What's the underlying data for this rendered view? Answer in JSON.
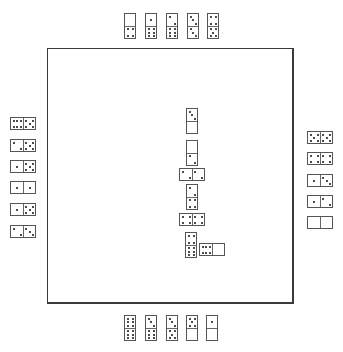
{
  "game": "dominoes",
  "colors": {
    "background": "#ffffff",
    "board_border": "#3a3a3a",
    "tile_border": "#555555",
    "pip": "#111111"
  },
  "board": {
    "x": 47,
    "y": 48,
    "width": 247,
    "height": 256
  },
  "hands": {
    "top": {
      "orientation": "vertical",
      "tiles": [
        {
          "a": 0,
          "b": 4,
          "x": 124,
          "y": 13
        },
        {
          "a": 1,
          "b": 6,
          "x": 145,
          "y": 13
        },
        {
          "a": 2,
          "b": 6,
          "x": 166,
          "y": 13
        },
        {
          "a": 3,
          "b": 3,
          "x": 187,
          "y": 13
        },
        {
          "a": 4,
          "b": 5,
          "x": 207,
          "y": 13
        }
      ]
    },
    "left": {
      "orientation": "horizontal",
      "tiles": [
        {
          "a": 6,
          "b": 5,
          "x": 10,
          "y": 117
        },
        {
          "a": 2,
          "b": 5,
          "x": 10,
          "y": 139
        },
        {
          "a": 1,
          "b": 5,
          "x": 10,
          "y": 160
        },
        {
          "a": 1,
          "b": 1,
          "x": 10,
          "y": 181
        },
        {
          "a": 1,
          "b": 5,
          "x": 10,
          "y": 203
        },
        {
          "a": 2,
          "b": 3,
          "x": 10,
          "y": 225
        }
      ]
    },
    "right": {
      "orientation": "horizontal",
      "tiles": [
        {
          "a": 5,
          "b": 5,
          "x": 307,
          "y": 131
        },
        {
          "a": 4,
          "b": 4,
          "x": 307,
          "y": 152
        },
        {
          "a": 1,
          "b": 3,
          "x": 307,
          "y": 174
        },
        {
          "a": 1,
          "b": 2,
          "x": 307,
          "y": 195
        },
        {
          "a": 0,
          "b": 0,
          "x": 307,
          "y": 216
        }
      ]
    },
    "bottom": {
      "orientation": "vertical",
      "tiles": [
        {
          "a": 6,
          "b": 6,
          "x": 124,
          "y": 315
        },
        {
          "a": 3,
          "b": 6,
          "x": 145,
          "y": 315
        },
        {
          "a": 3,
          "b": 5,
          "x": 166,
          "y": 315
        },
        {
          "a": 5,
          "b": 0,
          "x": 186,
          "y": 315
        },
        {
          "a": 1,
          "b": 0,
          "x": 206,
          "y": 315
        }
      ]
    }
  },
  "chain": [
    {
      "a": 3,
      "b": 0,
      "o": "v",
      "x": 186,
      "y": 108
    },
    {
      "a": 0,
      "b": 2,
      "o": "v",
      "x": 186,
      "y": 140
    },
    {
      "a": 2,
      "b": 2,
      "o": "h",
      "x": 179,
      "y": 168
    },
    {
      "a": 2,
      "b": 4,
      "o": "v",
      "x": 186,
      "y": 184
    },
    {
      "a": 4,
      "b": 4,
      "o": "h",
      "x": 179,
      "y": 213
    },
    {
      "a": 4,
      "b": 6,
      "o": "v",
      "x": 185,
      "y": 232
    },
    {
      "a": 6,
      "b": 0,
      "o": "h",
      "x": 199,
      "y": 243
    }
  ]
}
